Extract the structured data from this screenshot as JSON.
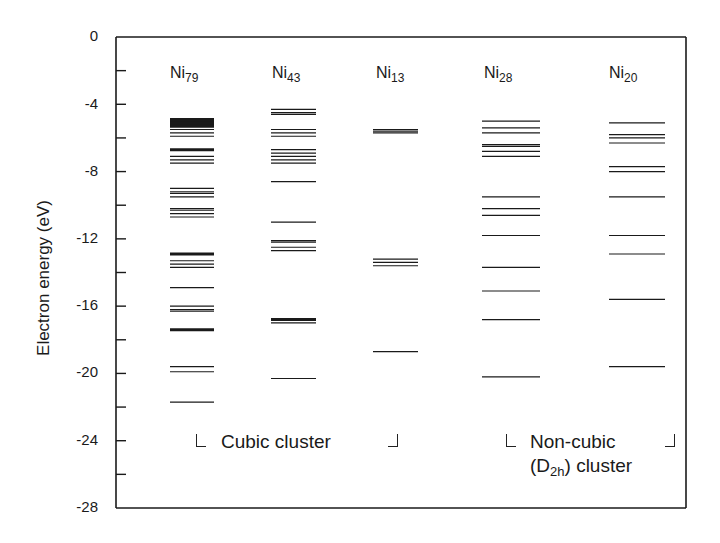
{
  "chart_data": {
    "type": "energy-level diagram",
    "title": "",
    "ylabel": "Electron energy (eV)",
    "xlabel": "",
    "ylim": [
      -28,
      0
    ],
    "yticks_major": [
      0,
      -4,
      -8,
      -12,
      -16,
      -20,
      -24,
      -28
    ],
    "yticks_minor": [
      -2,
      -6,
      -10,
      -14,
      -18,
      -22,
      -26
    ],
    "grid": false,
    "legend": null,
    "series": [
      {
        "name": "Ni79",
        "base": "Ni",
        "sub": "79",
        "group": "cubic",
        "levels": [
          -4.9,
          -5.0,
          -5.1,
          -5.2,
          -5.3,
          -5.5,
          -5.7,
          -5.9,
          -6.7,
          -7.1,
          -7.3,
          -7.5,
          -9.0,
          -9.2,
          -9.3,
          -9.5,
          -10.2,
          -10.3,
          -10.5,
          -10.7,
          -12.9,
          -13.3,
          -13.5,
          -13.7,
          -14.9,
          -16.0,
          -16.2,
          -16.3,
          -17.4,
          -19.6,
          -19.9,
          -21.7
        ],
        "thick_levels": [
          -4.9,
          -5.0,
          -5.1,
          -5.2,
          -5.3,
          -6.7,
          -12.9,
          -17.4
        ]
      },
      {
        "name": "Ni43",
        "base": "Ni",
        "sub": "43",
        "group": "cubic",
        "levels": [
          -4.3,
          -4.5,
          -4.6,
          -5.5,
          -5.7,
          -5.9,
          -6.7,
          -6.9,
          -7.1,
          -7.3,
          -7.5,
          -8.6,
          -11.0,
          -12.1,
          -12.2,
          -12.5,
          -12.7,
          -16.8,
          -17.0,
          -20.3
        ],
        "thick_levels": [
          -16.8
        ]
      },
      {
        "name": "Ni13",
        "base": "Ni",
        "sub": "13",
        "group": "cubic",
        "levels": [
          -5.5,
          -5.6,
          -5.7,
          -13.2,
          -13.4,
          -13.6,
          -18.7
        ],
        "thick_levels": []
      },
      {
        "name": "Ni28",
        "base": "Ni",
        "sub": "28",
        "group": "non-cubic",
        "levels": [
          -5.0,
          -5.4,
          -5.7,
          -6.4,
          -6.5,
          -6.8,
          -7.1,
          -9.5,
          -10.2,
          -10.6,
          -11.8,
          -13.7,
          -15.1,
          -16.8,
          -20.2
        ],
        "thick_levels": []
      },
      {
        "name": "Ni20",
        "base": "Ni",
        "sub": "20",
        "group": "non-cubic",
        "levels": [
          -5.1,
          -5.8,
          -6.0,
          -6.3,
          -7.7,
          -8.0,
          -9.5,
          -11.8,
          -12.9,
          -15.6,
          -19.6
        ],
        "thick_levels": []
      }
    ],
    "annotations": [
      {
        "text": "Cubic cluster",
        "spans": [
          "Ni79",
          "Ni43",
          "Ni13"
        ]
      },
      {
        "text": "Non-cubic (D2h) cluster",
        "spans": [
          "Ni28",
          "Ni20"
        ]
      }
    ]
  },
  "labels": {
    "y_axis_title": "Electron energy (eV)",
    "tick_labels": [
      "0",
      "-4",
      "-8",
      "-12",
      "-16",
      "-20",
      "-24",
      "-28"
    ],
    "columns": [
      {
        "base": "Ni",
        "sub": "79"
      },
      {
        "base": "Ni",
        "sub": "43"
      },
      {
        "base": "Ni",
        "sub": "13"
      },
      {
        "base": "Ni",
        "sub": "28"
      },
      {
        "base": "Ni",
        "sub": "20"
      }
    ],
    "cubic_group": "Cubic cluster",
    "noncubic_line1": "Non-cubic",
    "noncubic_line2_open": "(D",
    "noncubic_line2_sub": "2h",
    "noncubic_line2_close": ") cluster"
  },
  "colors": {
    "ink": "#1a1a1a",
    "background": "#ffffff"
  }
}
